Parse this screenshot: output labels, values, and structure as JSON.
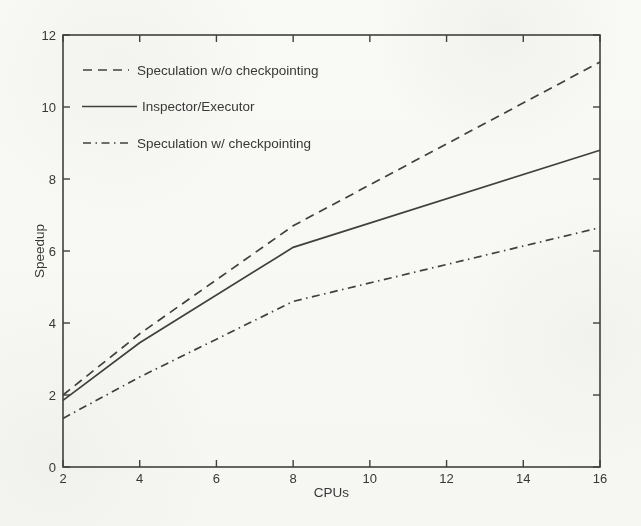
{
  "figure": {
    "kind": "scanned-matlab-style-plot",
    "ink_color": "#404040",
    "text_color": "#383838",
    "paper_color": "#f8f8f5"
  },
  "chart_data": {
    "type": "line",
    "title": "",
    "xlabel": "CPUs",
    "ylabel": "Speedup",
    "xlim": [
      2,
      16
    ],
    "ylim": [
      0,
      12
    ],
    "xticks": [
      2,
      4,
      6,
      8,
      10,
      12,
      14,
      16
    ],
    "yticks": [
      0,
      2,
      4,
      6,
      8,
      10,
      12
    ],
    "grid": false,
    "legend_position": "upper-left-inside",
    "legend_border": false,
    "x": [
      2,
      4,
      8,
      16
    ],
    "series": [
      {
        "name": "Speculation w/o checkpointing",
        "line_style": "dashed",
        "values": [
          2.0,
          3.7,
          6.7,
          11.25
        ]
      },
      {
        "name": "Inspector/Executor",
        "line_style": "solid",
        "values": [
          1.85,
          3.45,
          6.1,
          8.8
        ]
      },
      {
        "name": "Speculation w/ checkpointing",
        "line_style": "dash-dot",
        "values": [
          1.35,
          2.5,
          4.6,
          6.65
        ]
      }
    ]
  }
}
